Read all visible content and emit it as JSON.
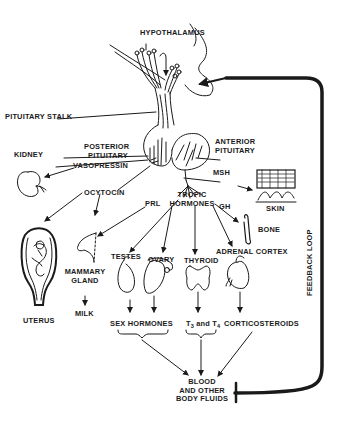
{
  "diagram": {
    "type": "endocrine-feedback-diagram",
    "colors": {
      "ink": "#1a1a1a",
      "background": "#ffffff"
    },
    "labels": {
      "hypothalamus": "HYPOTHALAMUS",
      "pituitary_stalk": "PITUITARY STALK",
      "posterior_pituitary_1": "POSTERIOR",
      "posterior_pituitary_2": "PITUITARY",
      "anterior_pituitary_1": "ANTERIOR",
      "anterior_pituitary_2": "PITUITARY",
      "kidney": "KIDNEY",
      "vasopressin": "VASOPRESSIN",
      "ocytocin": "OCYTOCIN",
      "msh": "MSH",
      "skin": "SKIN",
      "prl": "PRL",
      "tropic_hormones_1": "TROPIC",
      "tropic_hormones_2": "HORMONES",
      "gh": "GH",
      "bone": "BONE",
      "uterus": "UTERUS",
      "mammary_gland_1": "MAMMARY",
      "mammary_gland_2": "GLAND",
      "milk": "MILK",
      "testes": "TESTES",
      "ovary": "OVARY",
      "thyroid": "THYROID",
      "adrenal_cortex": "ADRENAL CORTEX",
      "sex_hormones": "SEX HORMONES",
      "t3_t4_prefix": "T",
      "t3_sub": "3",
      "t3_t4_and": " and T",
      "t4_sub": "4",
      "corticosteroids": "CORTICOSTEROIDS",
      "blood_1": "BLOOD",
      "blood_2": "AND OTHER",
      "blood_3": "BODY FLUIDS",
      "feedback_loop": "FEEDBACK LOOP"
    },
    "edges": [
      {
        "from": "Hypothalamus",
        "to": "Pituitary",
        "via": "Pituitary stalk"
      },
      {
        "from": "Posterior pituitary",
        "to": "Kidney",
        "label": "Vasopressin"
      },
      {
        "from": "Posterior pituitary",
        "to": "Uterus",
        "label": "Ocytocin"
      },
      {
        "from": "Posterior pituitary",
        "to": "Mammary gland",
        "label": "Ocytocin"
      },
      {
        "from": "Anterior pituitary",
        "to": "Skin",
        "label": "MSH"
      },
      {
        "from": "Anterior pituitary",
        "to": "Mammary gland",
        "label": "PRL"
      },
      {
        "from": "Anterior pituitary",
        "to": "Bone",
        "label": "GH"
      },
      {
        "from": "Anterior pituitary",
        "to": "Testes",
        "label": "Tropic hormones"
      },
      {
        "from": "Anterior pituitary",
        "to": "Ovary",
        "label": "Tropic hormones"
      },
      {
        "from": "Anterior pituitary",
        "to": "Thyroid",
        "label": "Tropic hormones"
      },
      {
        "from": "Anterior pituitary",
        "to": "Adrenal cortex",
        "label": "Tropic hormones"
      },
      {
        "from": "Mammary gland",
        "to": "Milk"
      },
      {
        "from": "Testes",
        "to": "Sex hormones"
      },
      {
        "from": "Ovary",
        "to": "Sex hormones"
      },
      {
        "from": "Thyroid",
        "to": "T3 and T4"
      },
      {
        "from": "Adrenal cortex",
        "to": "Corticosteroids"
      },
      {
        "from": "Sex hormones",
        "to": "Blood and other body fluids"
      },
      {
        "from": "T3 and T4",
        "to": "Blood and other body fluids"
      },
      {
        "from": "Corticosteroids",
        "to": "Blood and other body fluids"
      },
      {
        "from": "Blood and other body fluids",
        "to": "Hypothalamus/Pituitary",
        "label": "Feedback loop"
      }
    ]
  }
}
